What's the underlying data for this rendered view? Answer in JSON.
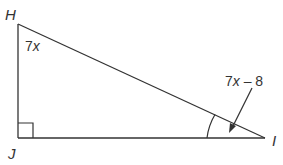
{
  "diagram": {
    "type": "right-triangle",
    "vertices": {
      "H": {
        "label": "H",
        "x": 18,
        "y": 24
      },
      "J": {
        "label": "J",
        "x": 18,
        "y": 138
      },
      "I": {
        "label": "I",
        "x": 265,
        "y": 138
      }
    },
    "right_angle_at": "J",
    "angle_labels": {
      "H": {
        "var": "7",
        "x": "x",
        "text": "7x"
      },
      "I": {
        "coef": "7",
        "x": "x",
        "rest": " – 8",
        "text": "7x – 8"
      }
    },
    "colors": {
      "stroke": "#333333",
      "background": "#ffffff"
    }
  }
}
